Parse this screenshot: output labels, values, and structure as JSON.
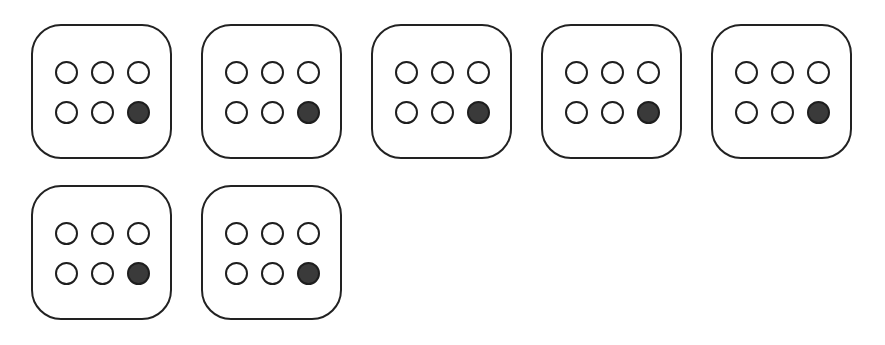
{
  "diagram": {
    "type": "braille-like dot cells",
    "rows": 2,
    "columns": 3,
    "cells": [
      {
        "id": 1,
        "dots": [
          0,
          0,
          0,
          0,
          0,
          1
        ]
      },
      {
        "id": 2,
        "dots": [
          0,
          0,
          0,
          0,
          0,
          1
        ]
      },
      {
        "id": 3,
        "dots": [
          0,
          0,
          0,
          0,
          0,
          1
        ]
      },
      {
        "id": 4,
        "dots": [
          0,
          0,
          0,
          0,
          0,
          1
        ]
      },
      {
        "id": 5,
        "dots": [
          0,
          0,
          0,
          0,
          0,
          1
        ]
      },
      {
        "id": 6,
        "dots": [
          0,
          0,
          0,
          0,
          0,
          1
        ]
      },
      {
        "id": 7,
        "dots": [
          0,
          0,
          0,
          0,
          0,
          1
        ]
      }
    ],
    "colors": {
      "outline": "#222222",
      "filled": "#3a3a3a",
      "empty": "#ffffff"
    }
  }
}
